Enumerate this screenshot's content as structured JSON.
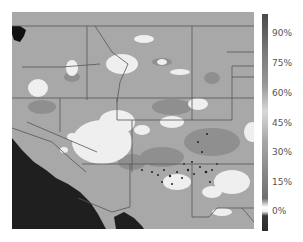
{
  "map": {
    "region": "Southwestern United States",
    "background_land": "#a9a9a9",
    "ocean_color": "#1e1e1e",
    "border_color": "#555555"
  },
  "colorbar": {
    "labels": [
      "90%",
      "75%",
      "60%",
      "45%",
      "30%",
      "15%",
      "0%"
    ],
    "label_y": [
      33,
      63,
      93,
      123,
      152,
      182,
      211
    ],
    "gradient_top": "#4a4a4a",
    "gradient_mid": "#d8d8d8",
    "gradient_bottom": "#3a3a3a"
  }
}
